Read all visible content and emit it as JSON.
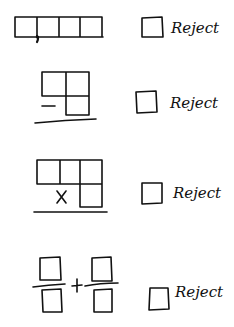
{
  "rows": [
    {
      "problem_type": "decimal",
      "reject_label": "Reject",
      "checked": false
    },
    {
      "problem_type": "subtraction",
      "operator": "−",
      "reject_label": "Reject",
      "checked": false
    },
    {
      "problem_type": "multiplication",
      "operator": "X",
      "reject_label": "Reject",
      "checked": false
    },
    {
      "problem_type": "fraction-addition",
      "operator": "+",
      "reject_label": "Reject",
      "checked": false
    }
  ],
  "colors": {
    "ink": "#111111",
    "background": "#ffffff"
  }
}
